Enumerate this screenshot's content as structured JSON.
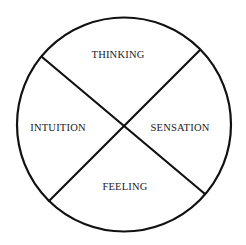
{
  "diagram": {
    "type": "quadrant-circle",
    "stroke_color": "#111111",
    "background": "#ffffff",
    "circle": {
      "cx": 124,
      "cy": 124.5,
      "r": 107
    },
    "dividers": [
      {
        "name": "diagonal-upper-left-to-lower-right",
        "x1": 42,
        "y1": 57,
        "x2": 205,
        "y2": 194
      },
      {
        "name": "diagonal-upper-right-to-lower-left",
        "x1": 200,
        "y1": 50,
        "x2": 49,
        "y2": 201
      }
    ],
    "quadrants": [
      {
        "position": "top",
        "label": "THINKING",
        "x": 118,
        "y": 58
      },
      {
        "position": "left",
        "label": "INTUITION",
        "x": 58,
        "y": 131
      },
      {
        "position": "right",
        "label": "SENSATION",
        "x": 180,
        "y": 131
      },
      {
        "position": "bottom",
        "label": "FEELING",
        "x": 125,
        "y": 190
      }
    ]
  }
}
